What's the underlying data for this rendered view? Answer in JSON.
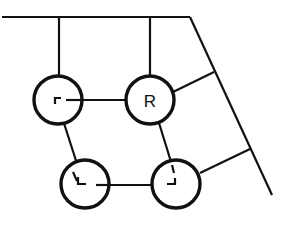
{
  "diagram": {
    "type": "structure-schematic",
    "stroke_color": "#111111",
    "background": "#ffffff",
    "rail": {
      "top": {
        "x1": 2,
        "y1": 17,
        "x2": 190,
        "y2": 17
      },
      "slant": {
        "x1": 190,
        "y1": 17,
        "x2": 272,
        "y2": 195
      }
    },
    "nodes": [
      {
        "id": "n1",
        "cx": 58,
        "cy": 100,
        "r": 24,
        "label": "",
        "glyph": "corner-top-left"
      },
      {
        "id": "n2",
        "cx": 150,
        "cy": 100,
        "r": 24,
        "label": "R",
        "glyph": ""
      },
      {
        "id": "n3",
        "cx": 85,
        "cy": 184,
        "r": 24,
        "label": "",
        "glyph": "corner-bottom-left"
      },
      {
        "id": "n4",
        "cx": 176,
        "cy": 184,
        "r": 24,
        "label": "",
        "glyph": "corner-bottom-right"
      }
    ],
    "edges": [
      {
        "from": "rail-top",
        "to": "n1",
        "x1": 59,
        "y1": 17,
        "x2": 59,
        "y2": 76
      },
      {
        "from": "rail-top",
        "to": "n2",
        "x1": 150,
        "y1": 17,
        "x2": 150,
        "y2": 76
      },
      {
        "from": "n1",
        "to": "n2",
        "x1": 75,
        "y1": 100,
        "x2": 126,
        "y2": 100
      },
      {
        "from": "n1",
        "to": "n3",
        "x1": 62,
        "y1": 117,
        "x2": 79,
        "y2": 170
      },
      {
        "from": "n2",
        "to": "n4",
        "x1": 159,
        "y1": 123,
        "x2": 172,
        "y2": 165
      },
      {
        "from": "n3",
        "to": "n4",
        "x1": 101,
        "y1": 185,
        "x2": 160,
        "y2": 185
      },
      {
        "from": "n2",
        "to": "rail-slant",
        "x1": 173,
        "y1": 92,
        "x2": 214,
        "y2": 72
      },
      {
        "from": "n4",
        "to": "rail-slant",
        "x1": 200,
        "y1": 173,
        "x2": 250,
        "y2": 149
      }
    ]
  }
}
